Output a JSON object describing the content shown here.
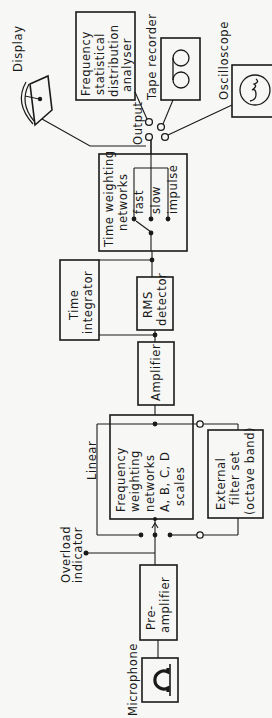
{
  "blocks": {
    "microphone": {
      "label": "Microphone"
    },
    "preamplifier": {
      "line1": "Pre-",
      "line2": "amplifier"
    },
    "overload": {
      "line1": "Overload",
      "line2": "indicator"
    },
    "linear": {
      "label": "Linear"
    },
    "freq_weighting": {
      "line1": "Frequency",
      "line2": "weighting",
      "line3": "networks",
      "line4": "A, B, C, D",
      "line5": "scales"
    },
    "external_filter": {
      "line1": "External",
      "line2": "filter set",
      "line3": "(octave band)"
    },
    "amplifier": {
      "label": "Amplifier"
    },
    "rms_detector": {
      "line1": "RMS",
      "line2": "detector"
    },
    "time_integrator": {
      "line1": "Time",
      "line2": "integrator"
    },
    "time_weighting": {
      "line1": "Time weighting",
      "line2": "networks",
      "fast": "fast",
      "slow": "slow",
      "impulse": "impulse"
    },
    "output": {
      "label": "Output"
    },
    "display": {
      "label": "Display"
    },
    "freq_stat_analyser": {
      "line1": "Frequency",
      "line2": "statistical",
      "line3": "distribution",
      "line4": "analyser"
    },
    "tape_recorder": {
      "label": "Tape recorder"
    },
    "oscilloscope": {
      "label": "Oscilloscope"
    }
  }
}
